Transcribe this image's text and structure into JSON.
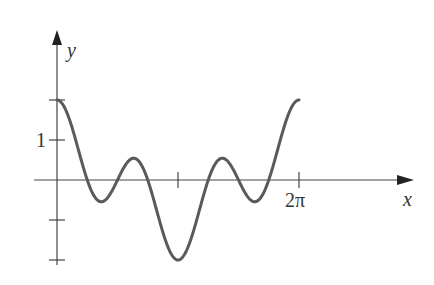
{
  "chart_data": {
    "type": "line",
    "title": "",
    "xlabel": "x",
    "ylabel": "y",
    "function": "y = cos x + cos 3x",
    "x_tick_labels": [
      "",
      "2π"
    ],
    "x_ticks": [
      3.14159,
      6.28319
    ],
    "y_tick_labels": [
      "1"
    ],
    "y_ticks": [
      2,
      1,
      -1,
      -2
    ],
    "xlim": [
      -0.6,
      9.0
    ],
    "ylim": [
      -2.3,
      3.0
    ],
    "grid": false,
    "legend": null,
    "series": [
      {
        "name": "curve",
        "x": [
          0,
          0.5236,
          1.0472,
          1.2,
          1.5708,
          1.9,
          2.0944,
          2.618,
          3.1416,
          3.6652,
          4.1888,
          4.383,
          4.7124,
          5.083,
          5.236,
          5.7596,
          6.2832
        ],
        "y": [
          2,
          0.866,
          -0.5,
          -0.53,
          0,
          0.51,
          0.5,
          -0.866,
          -2,
          -0.866,
          0.5,
          0.51,
          0,
          -0.53,
          -0.5,
          0.866,
          2
        ]
      }
    ],
    "color": "#5a5a5a"
  },
  "labels": {
    "x_axis": "x",
    "y_axis": "y",
    "x_tick_2pi": "2π",
    "y_tick_1": "1"
  }
}
